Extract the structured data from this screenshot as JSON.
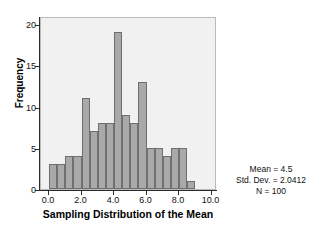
{
  "chart_data": {
    "type": "bar",
    "title": "",
    "subtitle": "",
    "xlabel": "Sampling Distribution of the Mean",
    "ylabel": "Frequency",
    "xlim": [
      -0.5,
      10.5
    ],
    "ylim": [
      0,
      21
    ],
    "grid": false,
    "legend": null,
    "bin_width": 0.5,
    "categories": [
      "0.0",
      "0.5",
      "1.0",
      "1.5",
      "2.0",
      "2.5",
      "3.0",
      "3.5",
      "4.0",
      "4.5",
      "5.0",
      "5.5",
      "6.0",
      "6.5",
      "7.0",
      "7.5",
      "8.0",
      "8.5"
    ],
    "bin_starts": [
      0.0,
      0.5,
      1.0,
      1.5,
      2.0,
      2.5,
      3.0,
      3.5,
      4.0,
      4.5,
      5.0,
      5.5,
      6.0,
      6.5,
      7.0,
      7.5,
      8.0,
      8.5
    ],
    "values": [
      3,
      3,
      4,
      4,
      11,
      7,
      8,
      8,
      19,
      9,
      8,
      13,
      5,
      5,
      4,
      5,
      5,
      1
    ],
    "xticks": [
      "0.0",
      "2.0",
      "4.0",
      "6.0",
      "8.0",
      "10.0"
    ],
    "xtick_values": [
      0,
      2,
      4,
      6,
      8,
      10
    ],
    "yticks": [
      "0",
      "5",
      "10",
      "15",
      "20"
    ],
    "ytick_values": [
      0,
      5,
      10,
      15,
      20
    ],
    "annotations": [
      "Mean = 4.5",
      "Std. Dev. = 2.0412",
      "N = 100"
    ],
    "colors": {
      "bar_fill": "#a9a9a9",
      "bar_edge": "#6f6f6f",
      "panel_background": "#f1f1f1",
      "figure_background": "#ffffff",
      "axis": "#2b2b2b",
      "text": "#111111"
    }
  },
  "stats": {
    "mean_label": "Mean = 4.5",
    "std_dev_label": "Std. Dev. = 2.0412",
    "n_label": "N = 100"
  }
}
